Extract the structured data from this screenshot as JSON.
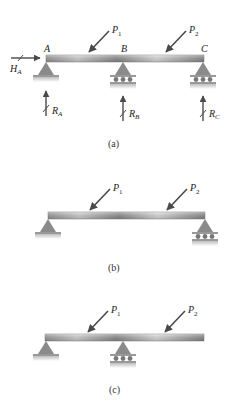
{
  "panels": [
    {
      "caption": "(a)",
      "loads": [
        {
          "name": "P",
          "sub": "1"
        },
        {
          "name": "P",
          "sub": "2"
        }
      ],
      "points": [
        "A",
        "B",
        "C"
      ],
      "reactions": [
        {
          "name": "H",
          "sub": "A"
        },
        {
          "name": "R",
          "sub": "A"
        },
        {
          "name": "R",
          "sub": "B"
        },
        {
          "name": "R",
          "sub": "C"
        }
      ],
      "supports": [
        "pin",
        "roller",
        "roller"
      ]
    },
    {
      "caption": "(b)",
      "loads": [
        {
          "name": "P",
          "sub": "1"
        },
        {
          "name": "P",
          "sub": "2"
        }
      ],
      "supports": [
        "pin",
        "roller"
      ]
    },
    {
      "caption": "(c)",
      "loads": [
        {
          "name": "P",
          "sub": "1"
        },
        {
          "name": "P",
          "sub": "2"
        }
      ],
      "supports": [
        "pin",
        "roller"
      ]
    }
  ],
  "colors": {
    "beam_light": "#e6e6e6",
    "beam_dark": "#8c8c8c",
    "support": "#8a8a8a",
    "arrow": "#4a4a4a",
    "ground": "#cfcfcf"
  }
}
